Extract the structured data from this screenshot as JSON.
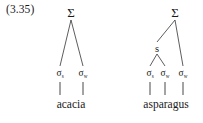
{
  "figure": {
    "example_number": "(3.35)",
    "background_color": "#ffffff",
    "line_color": "#333333",
    "text_color": "#1a1a1a"
  },
  "trees": [
    {
      "id": "acacia",
      "word": "acacia",
      "root_label": "Σ",
      "nodes": [
        {
          "label": "Σ",
          "sub": "",
          "kind": "root"
        },
        {
          "label": "σ",
          "sub": "s",
          "kind": "sigma"
        },
        {
          "label": "σ",
          "sub": "w",
          "kind": "sigma"
        }
      ],
      "leaves": [
        "σs",
        "σw"
      ]
    },
    {
      "id": "asparagus",
      "word": "asparagus",
      "root_label": "Σ",
      "intermediate_label": "s",
      "nodes": [
        {
          "label": "Σ",
          "sub": "",
          "kind": "root"
        },
        {
          "label": "s",
          "sub": "",
          "kind": "s"
        },
        {
          "label": "σ",
          "sub": "s",
          "kind": "sigma"
        },
        {
          "label": "σ",
          "sub": "w",
          "kind": "sigma"
        },
        {
          "label": "σ",
          "sub": "w",
          "kind": "sigma"
        }
      ],
      "leaves": [
        "σs",
        "σw",
        "σw"
      ]
    }
  ]
}
